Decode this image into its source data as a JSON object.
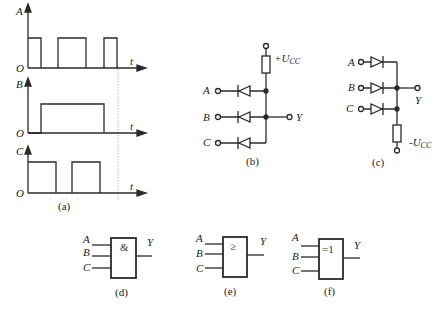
{
  "figure_a": {
    "caption": "(a)",
    "origin": "O",
    "time_axis": "t",
    "signals": [
      {
        "name": "A",
        "pulses": [
          [
            0,
            0.09
          ],
          [
            0.2,
            0.39
          ],
          [
            0.5,
            0.59
          ]
        ]
      },
      {
        "name": "B",
        "pulses": [
          [
            0.09,
            0.5
          ]
        ]
      },
      {
        "name": "C",
        "pulses": [
          [
            0,
            0.18
          ],
          [
            0.29,
            0.48
          ]
        ]
      }
    ]
  },
  "figure_b": {
    "caption": "(b)",
    "supply": "+U",
    "supply_sub": "CC",
    "inputs": [
      "A",
      "B",
      "C"
    ],
    "output": "Y"
  },
  "figure_c": {
    "caption": "(c)",
    "supply": "-U",
    "supply_sub": "CC",
    "inputs": [
      "A",
      "B",
      "C"
    ],
    "output": "Y"
  },
  "figure_d": {
    "caption": "(d)",
    "symbol": "&",
    "inputs": [
      "A",
      "B",
      "C"
    ],
    "output": "Y"
  },
  "figure_e": {
    "caption": "(e)",
    "symbol": "≥",
    "inputs": [
      "A",
      "B",
      "C"
    ],
    "output": "Y"
  },
  "figure_f": {
    "caption": "(f)",
    "symbol": "=1",
    "inputs": [
      "A",
      "B",
      "C"
    ],
    "output": "Y"
  },
  "colors": {
    "line": "#2a2a2a",
    "guide": "#888888"
  }
}
